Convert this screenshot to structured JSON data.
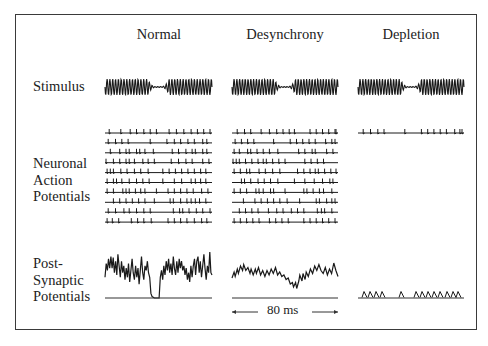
{
  "figure": {
    "columns": [
      {
        "title": "Normal",
        "x": 105,
        "w": 107
      },
      {
        "title": "Desynchrony",
        "x": 232,
        "w": 106
      },
      {
        "title": "Depletion",
        "x": 358,
        "w": 106
      }
    ],
    "rows": {
      "stimulus": {
        "label": "Stimulus",
        "y": 87
      },
      "action_potentials": {
        "label_lines": [
          "Neuronal",
          "Action",
          "Potentials"
        ],
        "y_first": 133,
        "spacing": 9.9
      },
      "psp": {
        "label_lines": [
          "Post-",
          "Synaptic",
          "Potentials"
        ],
        "baseline_y": 298
      }
    },
    "scale_bar": {
      "label": "80 ms",
      "x1": 232,
      "x2": 338,
      "y": 312
    },
    "spike_trains": {
      "normal": [
        [
          0.04,
          0.15,
          0.24,
          0.3,
          0.37,
          0.43,
          0.49,
          0.61,
          0.68,
          0.75,
          0.82,
          0.88,
          0.94,
          1.0
        ],
        [
          0.03,
          0.1,
          0.16,
          0.22,
          0.43,
          0.59,
          0.66,
          0.72,
          0.79,
          0.85,
          0.93,
          0.97
        ],
        [
          0.05,
          0.14,
          0.2,
          0.23,
          0.3,
          0.33,
          0.38,
          0.46,
          0.64,
          0.7,
          0.77,
          0.83,
          0.86,
          0.93,
          0.97
        ],
        [
          0.01,
          0.08,
          0.14,
          0.2,
          0.23,
          0.28,
          0.36,
          0.41,
          0.47,
          0.63,
          0.7,
          0.77,
          0.83,
          0.93,
          0.99
        ],
        [
          0.02,
          0.05,
          0.08,
          0.15,
          0.21,
          0.28,
          0.34,
          0.41,
          0.55,
          0.61,
          0.67,
          0.73,
          0.79,
          0.85,
          0.91,
          0.96
        ],
        [
          0.02,
          0.08,
          0.11,
          0.16,
          0.23,
          0.3,
          0.36,
          0.42,
          0.55,
          0.66,
          0.73,
          0.82,
          0.86,
          0.91,
          0.96
        ],
        [
          0.02,
          0.08,
          0.17,
          0.2,
          0.23,
          0.29,
          0.34,
          0.38,
          0.49,
          0.6,
          0.66,
          0.72,
          0.78,
          0.84,
          0.92,
          0.98
        ],
        [
          0.08,
          0.14,
          0.2,
          0.26,
          0.32,
          0.38,
          0.47,
          0.62,
          0.65,
          0.72,
          0.78,
          0.82,
          0.86,
          0.9,
          0.96
        ],
        [
          0.03,
          0.1,
          0.18,
          0.23,
          0.3,
          0.37,
          0.43,
          0.65,
          0.71,
          0.74,
          0.8,
          0.87,
          0.93,
          1.0
        ],
        [
          0.02,
          0.07,
          0.13,
          0.25,
          0.31,
          0.37,
          0.44,
          0.6,
          0.66,
          0.72,
          0.78,
          0.85,
          0.92,
          0.97
        ]
      ],
      "desynchrony": [
        [
          0.05,
          0.12,
          0.18,
          0.28,
          0.36,
          0.43,
          0.49,
          0.55,
          0.6,
          0.75,
          0.81,
          0.87,
          0.93,
          0.99,
          1.0
        ],
        [
          0.03,
          0.09,
          0.15,
          0.21,
          0.4,
          0.56,
          0.62,
          0.68,
          0.74,
          0.8,
          0.9,
          0.96,
          0.99
        ],
        [
          0.02,
          0.07,
          0.15,
          0.18,
          0.24,
          0.3,
          0.36,
          0.44,
          0.64,
          0.7,
          0.77,
          0.8,
          0.91,
          0.97
        ],
        [
          0.01,
          0.04,
          0.07,
          0.13,
          0.19,
          0.25,
          0.3,
          0.33,
          0.39,
          0.45,
          0.51,
          0.7,
          0.76,
          0.82,
          0.88
        ],
        [
          0.02,
          0.08,
          0.14,
          0.17,
          0.26,
          0.32,
          0.39,
          0.46,
          0.63,
          0.69,
          0.75,
          0.8,
          0.83,
          0.89,
          0.95,
          1.0
        ],
        [
          0.09,
          0.12,
          0.18,
          0.25,
          0.31,
          0.37,
          0.44,
          0.6,
          0.7,
          0.79,
          0.87,
          0.94,
          0.97
        ],
        [
          0.02,
          0.08,
          0.14,
          0.23,
          0.26,
          0.3,
          0.37,
          0.4,
          0.51,
          0.69,
          0.72,
          0.78,
          0.84,
          0.88,
          0.96
        ],
        [
          0.11,
          0.22,
          0.28,
          0.34,
          0.4,
          0.46,
          0.53,
          0.65,
          0.81,
          0.84,
          0.91,
          0.96,
          0.99
        ],
        [
          0.07,
          0.13,
          0.19,
          0.25,
          0.35,
          0.43,
          0.49,
          0.57,
          0.63,
          0.69,
          0.82,
          0.86,
          0.89,
          0.96
        ],
        [
          0.02,
          0.08,
          0.14,
          0.2,
          0.26,
          0.36,
          0.42,
          0.48,
          0.54,
          0.69,
          0.75,
          0.81,
          0.87,
          0.93,
          0.99
        ]
      ],
      "depletion": [
        [
          0.05,
          0.12,
          0.19,
          0.25,
          0.45,
          0.61,
          0.67,
          0.73,
          0.79,
          0.85,
          0.93,
          0.98,
          1.0
        ]
      ]
    },
    "psp_traces": {
      "normal": [
        [
          0,
          0.55
        ],
        [
          0.01,
          0.25
        ],
        [
          0.02,
          0.4
        ],
        [
          0.03,
          0.15
        ],
        [
          0.04,
          0.35
        ],
        [
          0.05,
          0.1
        ],
        [
          0.06,
          0.35
        ],
        [
          0.07,
          0.12
        ],
        [
          0.08,
          0.45
        ],
        [
          0.09,
          0.2
        ],
        [
          0.1,
          0.5
        ],
        [
          0.11,
          0.05
        ],
        [
          0.12,
          0.3
        ],
        [
          0.13,
          0.55
        ],
        [
          0.14,
          0.2
        ],
        [
          0.15,
          0.45
        ],
        [
          0.16,
          0.3
        ],
        [
          0.17,
          0.6
        ],
        [
          0.18,
          0.35
        ],
        [
          0.19,
          0.55
        ],
        [
          0.2,
          0.25
        ],
        [
          0.21,
          0.65
        ],
        [
          0.22,
          0.4
        ],
        [
          0.23,
          0.15
        ],
        [
          0.24,
          0.45
        ],
        [
          0.25,
          0.6
        ],
        [
          0.26,
          0.3
        ],
        [
          0.27,
          0.55
        ],
        [
          0.28,
          0.35
        ],
        [
          0.29,
          0.7
        ],
        [
          0.3,
          0.4
        ],
        [
          0.31,
          0.1
        ],
        [
          0.32,
          0.45
        ],
        [
          0.33,
          0.6
        ],
        [
          0.34,
          0.3
        ],
        [
          0.35,
          0.4
        ],
        [
          0.36,
          0.2
        ],
        [
          0.37,
          0.45
        ],
        [
          0.38,
          0.55
        ],
        [
          0.39,
          0.9
        ],
        [
          0.4,
          0.97
        ],
        [
          0.42,
          1.0
        ],
        [
          0.44,
          1.0
        ],
        [
          0.46,
          1.0
        ],
        [
          0.47,
          0.55
        ],
        [
          0.48,
          0.4
        ],
        [
          0.49,
          0.6
        ],
        [
          0.5,
          0.3
        ],
        [
          0.51,
          0.5
        ],
        [
          0.52,
          0.2
        ],
        [
          0.53,
          0.4
        ],
        [
          0.54,
          0.15
        ],
        [
          0.55,
          0.45
        ],
        [
          0.56,
          0.25
        ],
        [
          0.57,
          0.5
        ],
        [
          0.58,
          0.1
        ],
        [
          0.59,
          0.35
        ],
        [
          0.6,
          0.5
        ],
        [
          0.61,
          0.2
        ],
        [
          0.62,
          0.45
        ],
        [
          0.63,
          0.15
        ],
        [
          0.64,
          0.35
        ],
        [
          0.65,
          0.2
        ],
        [
          0.66,
          0.4
        ],
        [
          0.67,
          0.3
        ],
        [
          0.68,
          0.5
        ],
        [
          0.69,
          0.35
        ],
        [
          0.7,
          0.6
        ],
        [
          0.71,
          0.45
        ],
        [
          0.72,
          0.65
        ],
        [
          0.73,
          0.3
        ],
        [
          0.74,
          0.55
        ],
        [
          0.75,
          0.3
        ],
        [
          0.76,
          0.15
        ],
        [
          0.77,
          0.5
        ],
        [
          0.78,
          0.2
        ],
        [
          0.79,
          0.1
        ],
        [
          0.8,
          0.45
        ],
        [
          0.81,
          0.2
        ],
        [
          0.82,
          0.55
        ],
        [
          0.83,
          0.3
        ],
        [
          0.84,
          0.05
        ],
        [
          0.85,
          0.35
        ],
        [
          0.86,
          0.6
        ],
        [
          0.87,
          0.3
        ],
        [
          0.88,
          0.45
        ],
        [
          0.89,
          0.0
        ],
        [
          0.9,
          0.45
        ],
        [
          0.91,
          0.5
        ]
      ],
      "desynchrony": [
        [
          0,
          0.6
        ],
        [
          0.02,
          0.4
        ],
        [
          0.03,
          0.55
        ],
        [
          0.05,
          0.3
        ],
        [
          0.06,
          0.45
        ],
        [
          0.08,
          0.2
        ],
        [
          0.1,
          0.35
        ],
        [
          0.11,
          0.15
        ],
        [
          0.13,
          0.35
        ],
        [
          0.15,
          0.25
        ],
        [
          0.17,
          0.45
        ],
        [
          0.18,
          0.3
        ],
        [
          0.2,
          0.5
        ],
        [
          0.22,
          0.3
        ],
        [
          0.23,
          0.45
        ],
        [
          0.25,
          0.25
        ],
        [
          0.27,
          0.5
        ],
        [
          0.29,
          0.35
        ],
        [
          0.31,
          0.55
        ],
        [
          0.33,
          0.35
        ],
        [
          0.35,
          0.5
        ],
        [
          0.37,
          0.3
        ],
        [
          0.39,
          0.45
        ],
        [
          0.41,
          0.25
        ],
        [
          0.43,
          0.5
        ],
        [
          0.45,
          0.4
        ],
        [
          0.47,
          0.55
        ],
        [
          0.49,
          0.5
        ],
        [
          0.51,
          0.65
        ],
        [
          0.53,
          0.6
        ],
        [
          0.55,
          0.8
        ],
        [
          0.57,
          0.75
        ],
        [
          0.58,
          0.9
        ],
        [
          0.6,
          0.75
        ],
        [
          0.61,
          0.95
        ],
        [
          0.63,
          0.7
        ],
        [
          0.64,
          0.5
        ],
        [
          0.66,
          0.7
        ],
        [
          0.67,
          0.45
        ],
        [
          0.69,
          0.65
        ],
        [
          0.7,
          0.4
        ],
        [
          0.72,
          0.55
        ],
        [
          0.74,
          0.3
        ],
        [
          0.76,
          0.45
        ],
        [
          0.78,
          0.2
        ],
        [
          0.8,
          0.35
        ],
        [
          0.82,
          0.15
        ],
        [
          0.84,
          0.35
        ],
        [
          0.86,
          0.45
        ],
        [
          0.88,
          0.25
        ],
        [
          0.9,
          0.5
        ],
        [
          0.92,
          0.3
        ],
        [
          0.94,
          0.45
        ],
        [
          0.96,
          0.1
        ],
        [
          0.98,
          0.35
        ],
        [
          1.0,
          0.55
        ]
      ]
    },
    "depletion_bumps": [
      0.04,
      0.1,
      0.16,
      0.22,
      0.41,
      0.56,
      0.62,
      0.68,
      0.74,
      0.8,
      0.87,
      0.93,
      0.98
    ]
  }
}
